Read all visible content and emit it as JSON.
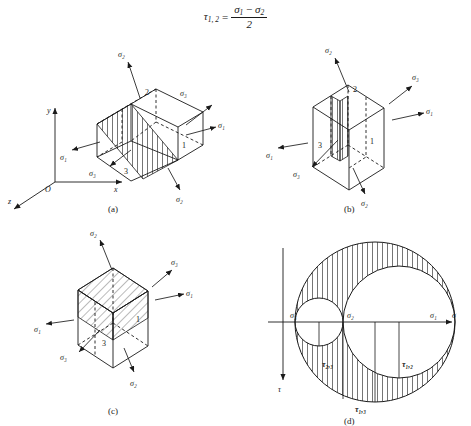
{
  "formula": {
    "lhs": "τ",
    "lhs_sub": "1, 2",
    "equals": "=",
    "numerator_left": "σ",
    "numerator_left_sub": "1",
    "minus": "−",
    "numerator_right": "σ",
    "numerator_right_sub": "2",
    "denominator": "2",
    "plain": "τ₁,₂ = (σ₁ − σ₂) / 2"
  },
  "symbols": {
    "sigma1": "σ₁",
    "sigma2": "σ₂",
    "sigma3": "σ₃",
    "sigma": "σ",
    "tau": "τ",
    "tau12": "τ₁,₂",
    "tau13": "τ₁,₃",
    "tau23": "τ₂,₃",
    "axis_x": "x",
    "axis_y": "y",
    "axis_z": "z",
    "origin": "O",
    "face1": "1",
    "face2": "2",
    "face3": "3"
  },
  "panels": [
    {
      "id": "a",
      "caption": "(a)",
      "type": "cube-with-inclined-plane",
      "has_coordinate_axes": true,
      "axes": [
        "y",
        "x",
        "z",
        "O"
      ],
      "stress_labels": [
        "σ₂",
        "σ₃",
        "σ₁",
        "σ₁",
        "σ₃",
        "σ₂"
      ],
      "face_numbers": [
        "1",
        "2",
        "3"
      ],
      "plane_description": "hatched plane inclined through cube, bisecting faces 1 and 3",
      "hatch_direction": "vertical"
    },
    {
      "id": "b",
      "caption": "(b)",
      "type": "cube-with-vertical-plane",
      "has_coordinate_axes": false,
      "stress_labels": [
        "σ₂",
        "σ₃",
        "σ₁",
        "σ₁",
        "σ₃",
        "σ₂"
      ],
      "face_numbers": [
        "1",
        "2",
        "3"
      ],
      "plane_description": "narrow hatched plane cutting vertically through cube between faces 1 and 3",
      "hatch_direction": "vertical"
    },
    {
      "id": "c",
      "caption": "(c)",
      "type": "cube-with-large-diagonal-plane",
      "has_coordinate_axes": false,
      "stress_labels": [
        "σ₂",
        "σ₃",
        "σ₁",
        "σ₁",
        "σ₃",
        "σ₂"
      ],
      "face_numbers": [
        "1",
        "3"
      ],
      "plane_description": "large diagonally hatched plane across upper half of cube",
      "hatch_direction": "diagonal"
    },
    {
      "id": "d",
      "caption": "(d)",
      "type": "mohr-circle-diagram",
      "axis_horizontal_label": "σ",
      "axis_vertical_label": "τ",
      "point_labels": [
        "σ₃",
        "σ₂",
        "σ₁"
      ],
      "shear_labels": [
        "τ₂,₃",
        "τ₁,₂",
        "τ₁,₃"
      ],
      "circles": [
        {
          "name": "large",
          "spans": "σ₃ to σ₁",
          "radius_label": "τ₁,₃"
        },
        {
          "name": "medium",
          "spans": "σ₂ to σ₁",
          "radius_label": "τ₁,₂"
        },
        {
          "name": "small",
          "spans": "σ₃ to σ₂",
          "radius_label": "τ₂,₃"
        }
      ],
      "shaded_region": "area inside large circle but outside medium and small circles",
      "hatch_direction": "vertical"
    }
  ],
  "colors": {
    "stroke": "#1a1a1a",
    "background": "#ffffff",
    "hatch": "#1a1a1a"
  }
}
